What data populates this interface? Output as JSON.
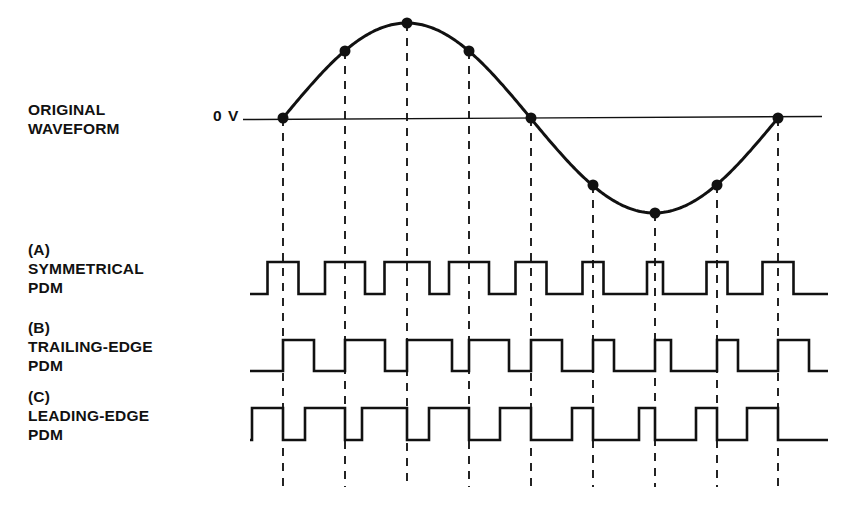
{
  "figure": {
    "title_labels": {
      "original": "ORIGINAL\nWAVEFORM",
      "a": "(A)\nSYMMETRICAL\nPDM",
      "b": "(B)\nTRAILING-EDGE\nPDM",
      "c": "(C)\nLEADING-EDGE\nPDM"
    },
    "zero_volt_label": "0 V",
    "colors": {
      "ink": "#111111",
      "background": "#ffffff",
      "dash": "#1a1a1a"
    }
  },
  "chart_data": {
    "type": "line",
    "xlabel": "",
    "ylabel": "",
    "grid": false,
    "legend_position": "left",
    "annotations": [
      "0 V",
      "ORIGINAL WAVEFORM",
      "(A) SYMMETRICAL PDM",
      "(B) TRAILING-EDGE PDM",
      "(C) LEADING-EDGE PDM"
    ],
    "geometry": {
      "plot_left_px": 283,
      "plot_right_px": 778,
      "sample_count": 9,
      "sample_spacing_px": 61.875,
      "zero_line_y_px": 118,
      "sine_amplitude_px": 95,
      "axis_line_x_start_px": 243,
      "axis_line_x_end_px": 822,
      "dash_bottom_y_px": 487,
      "trace_x_start_px": 250,
      "trace_x_end_px": 828,
      "row_a": {
        "high_y_px": 262,
        "low_y_px": 294
      },
      "row_b": {
        "high_y_px": 340,
        "low_y_px": 371
      },
      "row_c": {
        "high_y_px": 408,
        "low_y_px": 440
      }
    },
    "series": [
      {
        "name": "ORIGINAL WAVEFORM",
        "kind": "sine",
        "cycles": 1,
        "sample_x_px": [
          283,
          345,
          407,
          469,
          531,
          593,
          655,
          717,
          778
        ],
        "sample_phase_deg": [
          0,
          45,
          90,
          135,
          180,
          225,
          270,
          315,
          360
        ],
        "sample_values_normalized": [
          0,
          0.707,
          1,
          0.707,
          0,
          -0.707,
          -1,
          -0.707,
          0
        ],
        "sample_y_px": [
          118,
          51,
          23,
          51,
          118,
          185,
          213,
          185,
          118
        ],
        "marker": "filled-circle",
        "marker_radius_px": 5.5
      },
      {
        "name": "(A) SYMMETRICAL PDM",
        "kind": "pulse-train",
        "modulation": "symmetrical",
        "pulse_widths_px": [
          31,
          40,
          45,
          40,
          31,
          21,
          16,
          21,
          31
        ],
        "pulse_centers_px": [
          283,
          345,
          407,
          469,
          531,
          593,
          655,
          717,
          778
        ]
      },
      {
        "name": "(B) TRAILING-EDGE PDM",
        "kind": "pulse-train",
        "modulation": "trailing-edge",
        "pulse_widths_px": [
          31,
          40,
          45,
          40,
          31,
          21,
          16,
          21,
          31
        ],
        "pulse_rising_edges_px": [
          283,
          345,
          407,
          469,
          531,
          593,
          655,
          717,
          778
        ]
      },
      {
        "name": "(C) LEADING-EDGE PDM",
        "kind": "pulse-train",
        "modulation": "leading-edge",
        "pulse_widths_px": [
          31,
          40,
          45,
          40,
          31,
          21,
          16,
          21,
          31
        ],
        "pulse_falling_edges_px": [
          283,
          345,
          407,
          469,
          531,
          593,
          655,
          717,
          778
        ]
      }
    ]
  }
}
